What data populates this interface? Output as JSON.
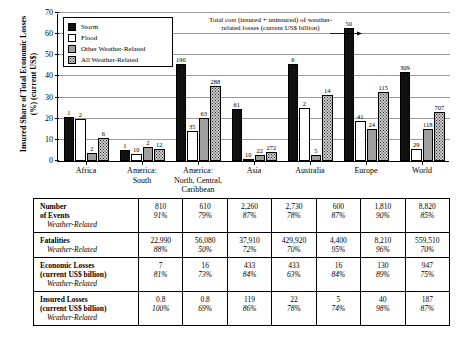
{
  "chart_data": {
    "type": "bar",
    "title": "",
    "xlabel": "",
    "ylabel": "Insured Share of Total Economic Losses (%) (current US$)",
    "ylim": [
      0,
      70
    ],
    "yticks": [
      0,
      10,
      20,
      30,
      40,
      50,
      60,
      70
    ],
    "grid": true,
    "legend_position": "upper-left",
    "annotation": "Total cost (insured + uninsured) of weather-related losses (current US$ billion)",
    "annotation_target_label": "50",
    "categories": [
      "Africa",
      "America:\nSouth",
      "America:\nNorth, Central,\nCaribbean",
      "Asia",
      "Australia",
      "Europe",
      "World"
    ],
    "series": [
      {
        "name": "Storm",
        "color": "#111111",
        "values": [
          21.0,
          5.0,
          46.0,
          24.5,
          46.0,
          63.0,
          42.0
        ],
        "point_labels": [
          "1",
          "1",
          "190",
          "61",
          "6",
          "50",
          "309"
        ]
      },
      {
        "name": "Flood",
        "color": "#ffffff",
        "values": [
          20.0,
          3.5,
          14.0,
          1.0,
          25.0,
          19.0,
          5.5
        ],
        "point_labels": [
          "2",
          "10",
          "35",
          "10",
          "2",
          "41",
          "29"
        ]
      },
      {
        "name": "Other Weather-Related",
        "color": "#9f9f9f",
        "values": [
          4.0,
          6.5,
          20.5,
          3.0,
          3.0,
          15.0,
          15.0
        ],
        "point_labels": [
          "2",
          "2",
          "63",
          "22",
          "5",
          "24",
          "118"
        ]
      },
      {
        "name": "All Weather-Related",
        "color": "#c9c9c9",
        "values": [
          11.0,
          5.5,
          35.5,
          4.5,
          31.0,
          32.5,
          23.0
        ],
        "point_labels": [
          "6",
          "12",
          "288",
          "272",
          "14",
          "115",
          "707"
        ]
      }
    ]
  },
  "legend": {
    "items": [
      {
        "label": "Storm",
        "key": "storm"
      },
      {
        "label": "Flood",
        "key": "flood"
      },
      {
        "label": "Other Weather-Related",
        "key": "other"
      },
      {
        "label": "All Weather-Related",
        "key": "all"
      }
    ]
  },
  "table": {
    "row_label_sub": "Weather-Related",
    "rows": [
      {
        "label_line1": "Number",
        "label_line2": "of Events",
        "values": [
          "810",
          "610",
          "2,260",
          "2,730",
          "600",
          "1,810",
          "8,820"
        ],
        "percents": [
          "91%",
          "79%",
          "87%",
          "78%",
          "87%",
          "90%",
          "85%"
        ]
      },
      {
        "label_line1": "Fatalities",
        "label_line2": "",
        "values": [
          "22,990",
          "56,080",
          "37,910",
          "429,920",
          "4,400",
          "8,210",
          "559,510"
        ],
        "percents": [
          "88%",
          "50%",
          "72%",
          "70%",
          "95%",
          "96%",
          "70%"
        ]
      },
      {
        "label_line1": "Economic Losses",
        "label_line2": "(current US$ billion)",
        "values": [
          "7",
          "16",
          "433",
          "433",
          "16",
          "130",
          "947"
        ],
        "percents": [
          "81%",
          "73%",
          "84%",
          "63%",
          "84%",
          "89%",
          "75%"
        ]
      },
      {
        "label_line1": "Insured Losses",
        "label_line2": "(current US$ billion)",
        "values": [
          "0.8",
          "0.8",
          "119",
          "22",
          "5",
          "40",
          "187"
        ],
        "percents": [
          "100%",
          "69%",
          "86%",
          "78%",
          "74%",
          "98%",
          "87%"
        ]
      }
    ]
  }
}
